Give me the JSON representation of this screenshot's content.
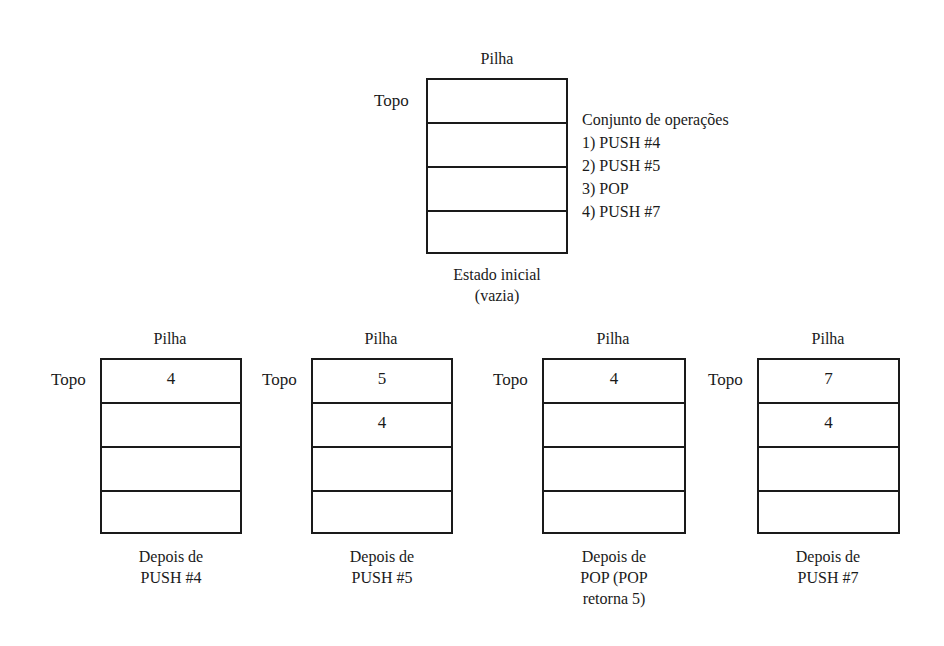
{
  "initial": {
    "title": "Pilha",
    "top_label": "Topo",
    "cells": [
      "",
      "",
      "",
      ""
    ],
    "caption_lines": [
      "Estado inicial",
      "(vazia)"
    ]
  },
  "operations": {
    "heading": "Conjunto de operações",
    "items": [
      "1) PUSH #4",
      "2) PUSH #5",
      "3) POP",
      "4) PUSH #7"
    ]
  },
  "stacks": [
    {
      "title": "Pilha",
      "top_label": "Topo",
      "cells": [
        "4",
        "",
        "",
        ""
      ],
      "caption_lines": [
        "Depois de",
        "PUSH #4"
      ]
    },
    {
      "title": "Pilha",
      "top_label": "Topo",
      "cells": [
        "5",
        "4",
        "",
        ""
      ],
      "caption_lines": [
        "Depois de",
        "PUSH #5"
      ]
    },
    {
      "title": "Pilha",
      "top_label": "Topo",
      "cells": [
        "4",
        "",
        "",
        ""
      ],
      "caption_lines": [
        "Depois de",
        "POP (POP",
        "retorna 5)"
      ]
    },
    {
      "title": "Pilha",
      "top_label": "Topo",
      "cells": [
        "7",
        "4",
        "",
        ""
      ],
      "caption_lines": [
        "Depois de",
        "PUSH #7"
      ]
    }
  ]
}
